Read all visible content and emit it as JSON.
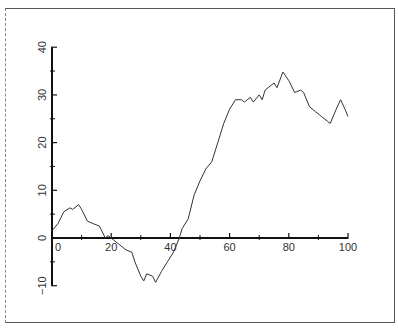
{
  "chart_data": {
    "type": "line",
    "title": "",
    "xlabel": "",
    "ylabel": "",
    "xlim": [
      0,
      100
    ],
    "ylim": [
      -10,
      40
    ],
    "grid": false,
    "legend": null,
    "x_ticks": [
      0,
      20,
      40,
      60,
      80,
      100
    ],
    "x_minor_ticks": [
      10,
      30,
      50,
      70,
      90
    ],
    "y_ticks": [
      -10,
      0,
      10,
      20,
      30,
      40
    ],
    "y_minor_ticks": [
      -5,
      5,
      15,
      25,
      35
    ],
    "x_tick_labels": [
      "0",
      "20",
      "40",
      "60",
      "80",
      "100"
    ],
    "y_tick_labels": [
      "-10",
      "0",
      "10",
      "20",
      "30",
      "40"
    ],
    "series": [
      {
        "name": "random walk",
        "color": "#333333",
        "x": [
          0,
          2,
          4,
          6,
          7,
          9,
          10,
          12,
          14,
          16,
          18,
          19,
          20,
          21,
          22,
          24,
          25,
          27,
          28,
          30,
          31,
          32,
          34,
          35,
          37,
          39,
          41,
          43,
          44,
          46,
          48,
          50,
          52,
          54,
          56,
          58,
          60,
          62,
          64,
          65,
          67,
          68,
          70,
          71,
          72,
          74,
          75,
          76,
          78,
          80,
          82,
          84,
          85,
          87,
          89,
          91,
          93,
          94,
          96,
          97.5,
          99,
          100
        ],
        "values": [
          1.5,
          3,
          5.5,
          6.3,
          6,
          7,
          6,
          3.5,
          3,
          2.5,
          0,
          0.5,
          0,
          -0.5,
          -1,
          -2,
          -2.5,
          -3,
          -5,
          -8,
          -9,
          -7.5,
          -8,
          -9.3,
          -7,
          -5,
          -3,
          0,
          2,
          4,
          9,
          12,
          14.5,
          16,
          20,
          24,
          27,
          29,
          29,
          28.5,
          29.5,
          28.5,
          30,
          29,
          31,
          32,
          32.5,
          31.5,
          34.8,
          33,
          30.5,
          31,
          30.5,
          27.5,
          26.5,
          25.5,
          24.5,
          24,
          27,
          29,
          27,
          25.5
        ]
      }
    ]
  }
}
